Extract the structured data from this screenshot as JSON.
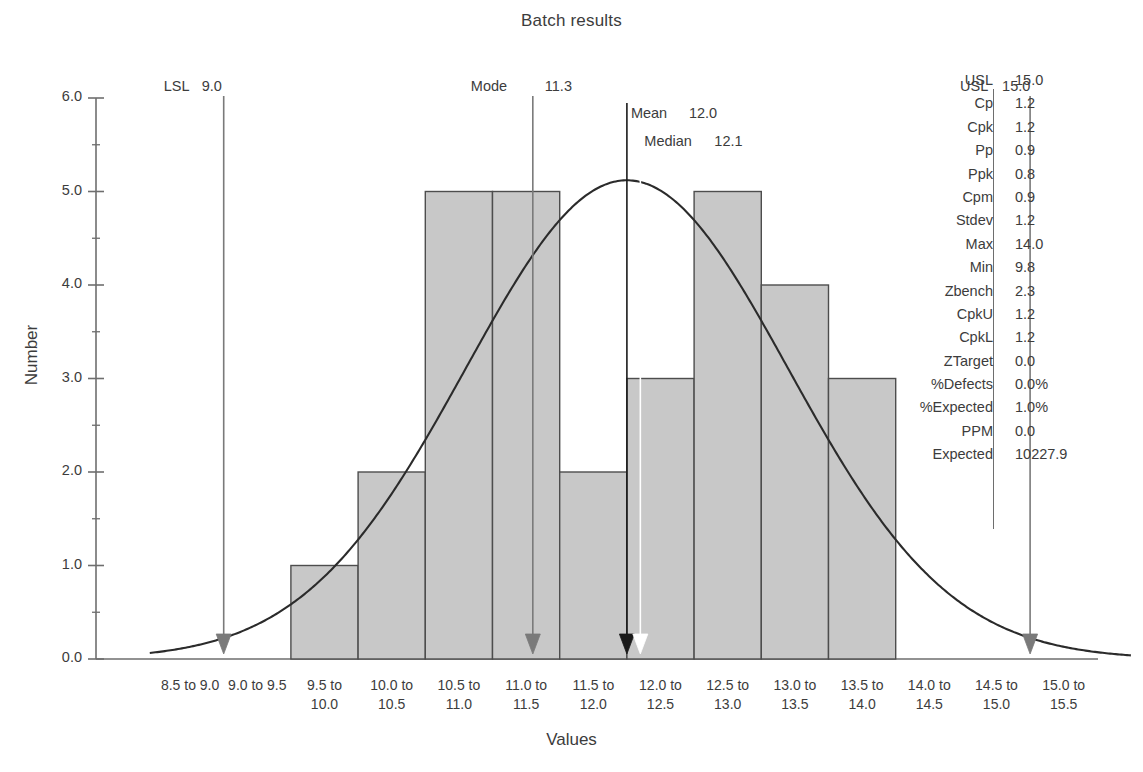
{
  "chart_data": {
    "type": "bar",
    "title": "Batch results",
    "xlabel": "Values",
    "ylabel": "Number",
    "ylim": [
      0.0,
      6.0
    ],
    "ytick_labels": [
      "0.0",
      "1.0",
      "2.0",
      "3.0",
      "4.0",
      "5.0",
      "6.0"
    ],
    "ytick_values": [
      0,
      1,
      2,
      3,
      4,
      5,
      6
    ],
    "grid": false,
    "legend": "none",
    "categories": [
      "8.5 to\n9.0",
      "9.0 to\n9.5",
      "9.5 to\n10.0",
      "10.0 to\n10.5",
      "10.5 to\n11.0",
      "11.0 to\n11.5",
      "11.5 to\n12.0",
      "12.0 to\n12.5",
      "12.5 to\n13.0",
      "13.0 to\n13.5",
      "13.5 to\n14.0",
      "14.0 to\n14.5",
      "14.5 to\n15.0",
      "15.0 to\n15.5"
    ],
    "values": [
      0,
      0,
      1,
      2,
      5,
      5,
      2,
      3,
      5,
      4,
      3,
      0,
      0,
      0
    ],
    "overlay": {
      "type": "line",
      "name": "normal-distribution-curve",
      "mean": 12.0,
      "stdev": 1.2,
      "peak": 5.12,
      "color": "#2b2b2b"
    },
    "markers": [
      {
        "name": "LSL",
        "value": "9.0",
        "color": "#7a7a7a",
        "x": 9.0
      },
      {
        "name": "Mode",
        "value": "11.3",
        "color": "#7a7a7a",
        "x": 11.3
      },
      {
        "name": "Mean",
        "value": "12.0",
        "color": "#1a1a1a",
        "x": 12.0
      },
      {
        "name": "Median",
        "value": "12.1",
        "color": "#ffffff",
        "x": 12.1
      },
      {
        "name": "USL",
        "value": "15.0",
        "color": "#7a7a7a",
        "x": 15.0
      }
    ]
  },
  "stats": {
    "rows": [
      {
        "label": "USL",
        "value": "15.0"
      },
      {
        "label": "Cp",
        "value": "1.2"
      },
      {
        "label": "Cpk",
        "value": "1.2"
      },
      {
        "label": "Pp",
        "value": "0.9"
      },
      {
        "label": "Ppk",
        "value": "0.8"
      },
      {
        "label": "Cpm",
        "value": "0.9"
      },
      {
        "label": "Stdev",
        "value": "1.2"
      },
      {
        "label": "Max",
        "value": "14.0"
      },
      {
        "label": "Min",
        "value": "9.8"
      },
      {
        "label": "Zbench",
        "value": "2.3"
      },
      {
        "label": "CpkU",
        "value": "1.2"
      },
      {
        "label": "CpkL",
        "value": "1.2"
      },
      {
        "label": "ZTarget",
        "value": "0.0"
      },
      {
        "label": "%Defects",
        "value": "0.0%"
      },
      {
        "label": "%Expected",
        "value": "1.0%"
      },
      {
        "label": "PPM",
        "value": "0.0"
      },
      {
        "label": "Expected",
        "value": "10227.9"
      }
    ]
  },
  "colors": {
    "bar_fill": "#c8c8c8",
    "bar_stroke": "#4d4d4d",
    "axis": "#6e6e6e",
    "curve": "#2b2b2b",
    "text": "#3c3c3c",
    "background": "#ffffff"
  }
}
